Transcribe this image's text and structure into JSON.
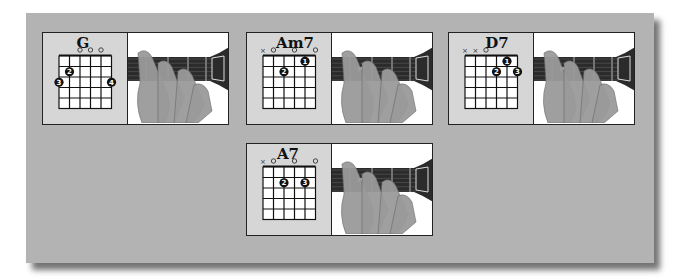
{
  "strings": [
    "E",
    "A",
    "D",
    "G",
    "B",
    "e"
  ],
  "chords": [
    {
      "name": "G",
      "markers": [
        "",
        "",
        "o",
        "o",
        "o",
        ""
      ],
      "fingers": [
        {
          "string": 6,
          "fret": 3,
          "finger": "3"
        },
        {
          "string": 5,
          "fret": 2,
          "finger": "2"
        },
        {
          "string": 1,
          "fret": 3,
          "finger": "4"
        }
      ],
      "photo": "hand-fretting-G-chord"
    },
    {
      "name": "Am7",
      "markers": [
        "x",
        "o",
        "",
        "o",
        "",
        "o"
      ],
      "fingers": [
        {
          "string": 4,
          "fret": 2,
          "finger": "2"
        },
        {
          "string": 2,
          "fret": 1,
          "finger": "1"
        }
      ],
      "photo": "hand-fretting-Am7-chord"
    },
    {
      "name": "D7",
      "markers": [
        "x",
        "x",
        "o",
        "",
        "",
        ""
      ],
      "fingers": [
        {
          "string": 3,
          "fret": 2,
          "finger": "2"
        },
        {
          "string": 2,
          "fret": 1,
          "finger": "1"
        },
        {
          "string": 1,
          "fret": 2,
          "finger": "3"
        }
      ],
      "photo": "hand-fretting-D7-chord"
    },
    {
      "name": "A7",
      "markers": [
        "x",
        "o",
        "",
        "o",
        "",
        "o"
      ],
      "fingers": [
        {
          "string": 4,
          "fret": 2,
          "finger": "2"
        },
        {
          "string": 2,
          "fret": 2,
          "finger": "3"
        }
      ],
      "photo": "hand-fretting-A7-chord"
    }
  ],
  "colors": {
    "panel": "#b3b3b3",
    "fretboard": "#2b2b2b",
    "finger_dot": "#111111",
    "skin": "#9a9a9a"
  }
}
